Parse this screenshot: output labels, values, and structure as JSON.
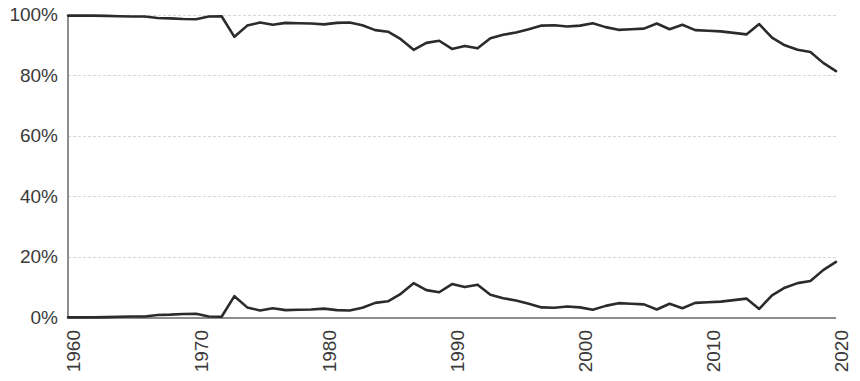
{
  "chart_data": {
    "type": "line",
    "title": "",
    "subtitle": "",
    "xlabel": "",
    "ylabel": "",
    "xlim": [
      1960,
      2020
    ],
    "ylim": [
      0,
      100
    ],
    "grid": true,
    "grid_axis": "y",
    "legend": "none",
    "value_format": "percent",
    "x": [
      1960,
      1961,
      1962,
      1963,
      1964,
      1965,
      1966,
      1967,
      1968,
      1969,
      1970,
      1971,
      1972,
      1973,
      1974,
      1975,
      1976,
      1977,
      1978,
      1979,
      1980,
      1981,
      1982,
      1983,
      1984,
      1985,
      1986,
      1987,
      1988,
      1989,
      1990,
      1991,
      1992,
      1993,
      1994,
      1995,
      1996,
      1997,
      1998,
      1999,
      2000,
      2001,
      2002,
      2003,
      2004,
      2005,
      2006,
      2007,
      2008,
      2009,
      2010,
      2011,
      2012,
      2013,
      2014,
      2015,
      2016,
      2017,
      2018,
      2019,
      2020
    ],
    "x_tick_labels": [
      "1960",
      "1970",
      "1980",
      "1990",
      "2000",
      "2010",
      "2020"
    ],
    "x_tick_values": [
      1960,
      1970,
      1980,
      1990,
      2000,
      2010,
      2020
    ],
    "x_tick_rotation": -90,
    "y_tick_labels": [
      "0%",
      "20%",
      "40%",
      "60%",
      "80%",
      "100%"
    ],
    "y_tick_values": [
      0,
      20,
      40,
      60,
      80,
      100
    ],
    "line_color": "#2b2b2b",
    "grid_color": "#d6d6d6",
    "axis_color": "#8d8d8d",
    "background_color": "#ffffff",
    "series": [
      {
        "name": "upper-series",
        "values": [
          99.8,
          99.8,
          99.8,
          99.7,
          99.6,
          99.5,
          99.5,
          99.0,
          98.9,
          98.7,
          98.6,
          99.5,
          99.6,
          92.8,
          96.5,
          97.5,
          96.8,
          97.4,
          97.3,
          97.2,
          96.9,
          97.4,
          97.5,
          96.6,
          95.0,
          94.5,
          92.0,
          88.5,
          90.8,
          91.5,
          88.8,
          89.8,
          89.0,
          92.3,
          93.5,
          94.2,
          95.3,
          96.5,
          96.6,
          96.2,
          96.5,
          97.3,
          96.0,
          95.1,
          95.3,
          95.5,
          97.2,
          95.3,
          96.8,
          95.0,
          94.8,
          94.6,
          94.1,
          93.6,
          97.0,
          92.5,
          90.0,
          88.5,
          87.8,
          84.2,
          81.5
        ]
      },
      {
        "name": "lower-series",
        "values": [
          0.2,
          0.2,
          0.2,
          0.3,
          0.4,
          0.5,
          0.5,
          1.0,
          1.1,
          1.3,
          1.4,
          0.5,
          0.4,
          7.2,
          3.5,
          2.5,
          3.2,
          2.6,
          2.7,
          2.8,
          3.1,
          2.6,
          2.5,
          3.4,
          5.0,
          5.5,
          8.0,
          11.5,
          9.2,
          8.5,
          11.2,
          10.2,
          11.0,
          7.7,
          6.5,
          5.8,
          4.7,
          3.5,
          3.4,
          3.8,
          3.5,
          2.7,
          4.0,
          4.9,
          4.7,
          4.5,
          2.8,
          4.7,
          3.2,
          5.0,
          5.2,
          5.4,
          5.9,
          6.4,
          3.0,
          7.5,
          10.0,
          11.5,
          12.2,
          15.8,
          18.5
        ]
      }
    ]
  },
  "axes": {
    "y_label_0": "0%",
    "y_label_20": "20%",
    "y_label_40": "40%",
    "y_label_60": "60%",
    "y_label_80": "80%",
    "y_label_100": "100%",
    "x_label_1960": "1960",
    "x_label_1970": "1970",
    "x_label_1980": "1980",
    "x_label_1990": "1990",
    "x_label_2000": "2000",
    "x_label_2010": "2010",
    "x_label_2020": "2020"
  }
}
